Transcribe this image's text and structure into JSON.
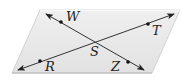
{
  "diagram": {
    "type": "geometry",
    "plane": {
      "shape": "parallelogram",
      "fill": "#e6e6e6",
      "edge_light": "#f4f4f4",
      "edge_dark": "#bdbdbd",
      "corners": [
        [
          40,
          10
        ],
        [
          180,
          10
        ],
        [
          152,
          73
        ],
        [
          12,
          73
        ]
      ]
    },
    "lines": [
      {
        "name": "RT",
        "from": [
          18,
          70
        ],
        "to": [
          174,
          14
        ],
        "arrows": "both"
      },
      {
        "name": "WZ",
        "from": [
          46,
          14
        ],
        "to": [
          144,
          70
        ],
        "arrows": "both"
      }
    ],
    "points": [
      {
        "id": "W",
        "label": "W",
        "pos": [
          61,
          22
        ],
        "label_pos": [
          66,
          21
        ],
        "dot": true
      },
      {
        "id": "T",
        "label": "T",
        "pos": [
          148,
          24
        ],
        "label_pos": [
          152,
          35
        ],
        "dot": true
      },
      {
        "id": "S",
        "label": "S",
        "pos": [
          95,
          42
        ],
        "label_pos": [
          90,
          56
        ],
        "dot": false
      },
      {
        "id": "R",
        "label": "R",
        "pos": [
          40,
          61
        ],
        "label_pos": [
          45,
          71
        ],
        "dot": true
      },
      {
        "id": "Z",
        "label": "Z",
        "pos": [
          128,
          62
        ],
        "label_pos": [
          111,
          71
        ],
        "dot": true
      }
    ],
    "line_color": "#333333",
    "point_color": "#111111"
  },
  "labels": {
    "W": "W",
    "T": "T",
    "S": "S",
    "R": "R",
    "Z": "Z"
  }
}
